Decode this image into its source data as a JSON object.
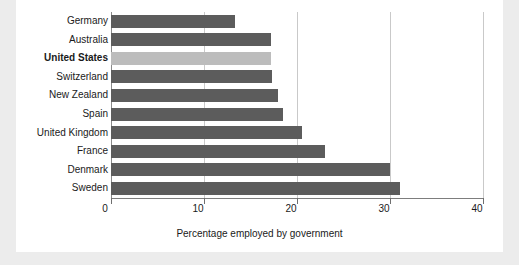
{
  "chart_data": {
    "type": "bar",
    "orientation": "horizontal",
    "title": "",
    "xlabel": "Percentage employed by government",
    "ylabel": "",
    "xlim": [
      0,
      40
    ],
    "xticks": [
      0,
      10,
      20,
      30,
      40
    ],
    "xtick_labels": [
      "0",
      "10",
      "20",
      "30",
      "40"
    ],
    "grid": true,
    "grid_axis": "x",
    "legend": false,
    "categories": [
      "Germany",
      "Australia",
      "United States",
      "Switzerland",
      "New Zealand",
      "Spain",
      "United Kingdom",
      "France",
      "Denmark",
      "Sweden"
    ],
    "values": [
      13.3,
      17.2,
      17.2,
      17.3,
      18.0,
      18.5,
      20.5,
      23.0,
      30.0,
      31.1
    ],
    "highlight_category": "United States",
    "colors": {
      "bar": "#5c5c5c",
      "bar_highlight": "#bcbcbc",
      "grid": "#c9c9c9",
      "axis": "#7d7d7d",
      "text": "#1a1a1a",
      "panel_background": "#ffffff",
      "page_background": "#ececec"
    },
    "bars": [
      {
        "label": "Germany",
        "value": 13.3,
        "highlight": false
      },
      {
        "label": "Australia",
        "value": 17.2,
        "highlight": false
      },
      {
        "label": "United States",
        "value": 17.2,
        "highlight": true
      },
      {
        "label": "Switzerland",
        "value": 17.3,
        "highlight": false
      },
      {
        "label": "New Zealand",
        "value": 18.0,
        "highlight": false
      },
      {
        "label": "Spain",
        "value": 18.5,
        "highlight": false
      },
      {
        "label": "United Kingdom",
        "value": 20.5,
        "highlight": false
      },
      {
        "label": "France",
        "value": 23.0,
        "highlight": false
      },
      {
        "label": "Denmark",
        "value": 30.0,
        "highlight": false
      },
      {
        "label": "Sweden",
        "value": 31.1,
        "highlight": false
      }
    ]
  }
}
